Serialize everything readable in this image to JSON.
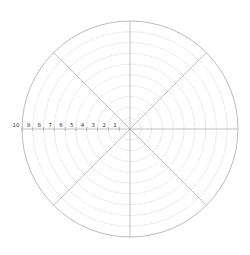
{
  "chart_data": {
    "type": "polar",
    "title": "",
    "radial_axis": {
      "range": [
        0,
        10
      ],
      "tick_labels": [
        "1",
        "2",
        "3",
        "4",
        "5",
        "6",
        "7",
        "8",
        "9",
        "10"
      ],
      "tick_values": [
        1,
        2,
        3,
        4,
        5,
        6,
        7,
        8,
        9,
        10
      ],
      "label_position": "left horizontal axis"
    },
    "angular_axis": {
      "spokes_deg": [
        0,
        45,
        90,
        135,
        180,
        225,
        270,
        315
      ],
      "tick_labels": []
    },
    "series": [],
    "grid": true
  },
  "style": {
    "outer_circle_color": "#aaaaaa",
    "spoke_color": "#999999",
    "ring_color": "#bbbbbb",
    "axis_color": "#999999",
    "label_color": "#333333"
  },
  "geometry": {
    "cx": 130,
    "cy": 129,
    "radius": 108
  }
}
